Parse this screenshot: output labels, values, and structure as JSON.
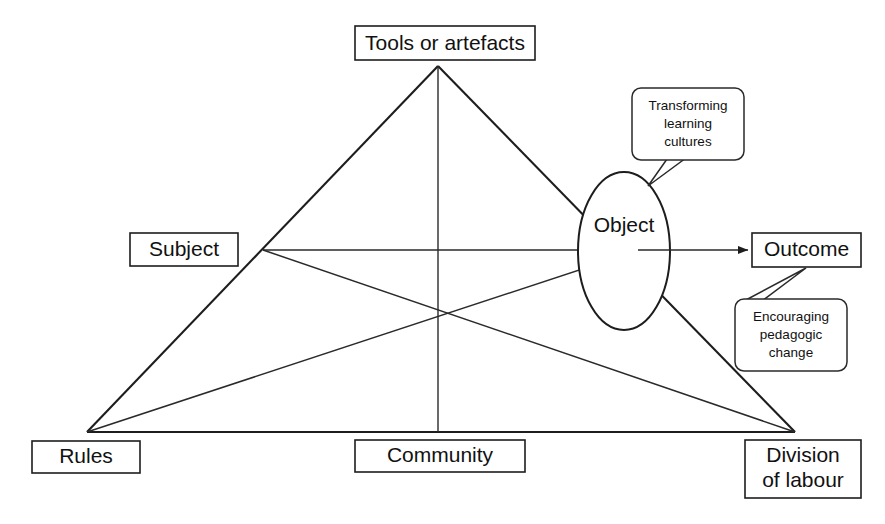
{
  "diagram": {
    "type": "activity-theory-triangle",
    "background_color": "#ffffff",
    "line_color": "#1d1d1d",
    "text_color": "#111111",
    "nodes": {
      "tools": {
        "label": "Tools or artefacts"
      },
      "subject": {
        "label": "Subject"
      },
      "object": {
        "label": "Object"
      },
      "outcome": {
        "label": "Outcome"
      },
      "rules": {
        "label": "Rules"
      },
      "community": {
        "label": "Community"
      },
      "division": {
        "label_line1": "Division",
        "label_line2": "of labour"
      }
    },
    "callouts": {
      "object_note": {
        "line1": "Transforming",
        "line2": "learning",
        "line3": "cultures"
      },
      "outcome_note": {
        "line1": "Encouraging",
        "line2": "pedagogic",
        "line3": "change"
      }
    }
  }
}
